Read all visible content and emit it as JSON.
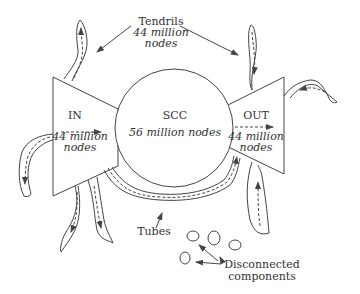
{
  "diagram": {
    "colors": {
      "stroke": "#444444",
      "text": "#333333",
      "background": "#ffffff"
    },
    "nodes": {
      "tendrils": {
        "label": "Tendrils",
        "count": "44 million",
        "unit": "nodes"
      },
      "in": {
        "label": "IN",
        "count": "44 million",
        "unit": "nodes"
      },
      "scc": {
        "label": "SCC",
        "count": "56 million nodes"
      },
      "out": {
        "label": "OUT",
        "count": "44 million",
        "unit": "nodes"
      },
      "tubes": {
        "label": "Tubes"
      },
      "disconnected": {
        "line1": "Disconnected",
        "line2": "components"
      }
    },
    "edges": [
      {
        "from": "in",
        "to": "scc",
        "style": "dashed-arrow"
      },
      {
        "from": "scc",
        "to": "out",
        "style": "dashed-arrow"
      },
      {
        "from": "in",
        "to": "out",
        "via": "tubes",
        "style": "dashed-arrow"
      },
      {
        "from": "in",
        "to": "tendrils",
        "style": "dashed-arrow"
      },
      {
        "from": "tendrils",
        "to": "out",
        "style": "dashed-arrow"
      }
    ]
  }
}
